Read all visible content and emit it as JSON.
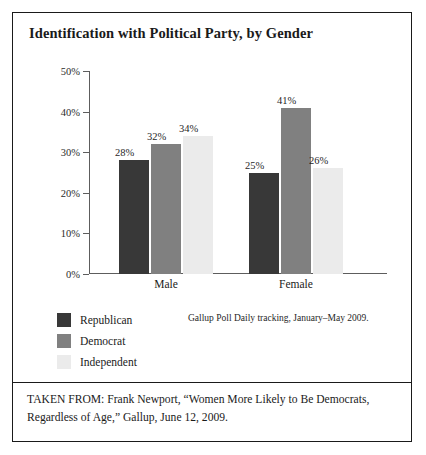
{
  "chart_data": {
    "type": "bar",
    "title": "Identification with Political Party, by Gender",
    "categories": [
      "Male",
      "Female"
    ],
    "series": [
      {
        "name": "Republican",
        "values": [
          28,
          32
        ],
        "color": "#383838"
      },
      {
        "name": "Democrat",
        "values": [
          32,
          41
        ],
        "color": "#808080"
      },
      {
        "name": "Independent",
        "values": [
          34,
          26
        ],
        "color": "#ebebeb"
      }
    ],
    "values_by_group": {
      "Male": [
        28,
        32,
        34
      ],
      "Female": [
        25,
        41,
        26
      ]
    },
    "value_labels": {
      "Male": [
        "28%",
        "32%",
        "34%"
      ],
      "Female": [
        "25%",
        "41%",
        "26%"
      ]
    },
    "xlabel": "",
    "ylabel": "",
    "ylim": [
      0,
      50
    ],
    "ytick_values": [
      50,
      40,
      30,
      20,
      10,
      0
    ],
    "ytick_labels": [
      "50%",
      "40%",
      "30%",
      "20%",
      "10%",
      "0%"
    ],
    "grid": false,
    "legend_position": "bottom-left",
    "source_note": "Gallup Poll Daily tracking, January–May 2009."
  },
  "legend": {
    "items": [
      {
        "label": "Republican",
        "color": "#383838"
      },
      {
        "label": "Democrat",
        "color": "#808080"
      },
      {
        "label": "Independent",
        "color": "#ebebeb"
      }
    ]
  },
  "footer": {
    "text": "TAKEN FROM: Frank Newport, “Women More Likely to Be Democrats, Regardless of Age,” Gallup, June 12, 2009."
  }
}
